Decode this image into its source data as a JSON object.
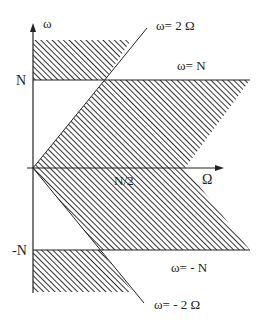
{
  "diagram": {
    "axes": {
      "vertical_label": "ω",
      "horizontal_label": "Ω"
    },
    "tick_labels": {
      "n_positive": "N",
      "n_negative": "-N",
      "n_half": "N/2"
    },
    "line_labels": {
      "omega_eq_2Omega": "ω= 2 Ω",
      "omega_eq_N": "ω= N",
      "omega_eq_minusN": "ω= - N",
      "omega_eq_minus2Omega": "ω= - 2 Ω"
    },
    "colors": {
      "ink": "#222222",
      "hatch": "#333333",
      "background": "#ffffff"
    }
  }
}
